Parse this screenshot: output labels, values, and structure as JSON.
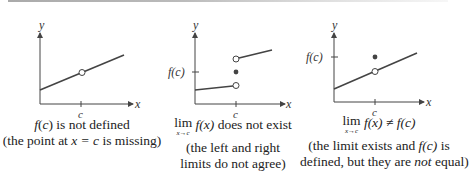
{
  "panels": [
    {
      "axis_y": "y",
      "axis_x": "x",
      "tick_x": "c",
      "caption_line1": "f(c) is not defined",
      "caption_line2_pre": "(the point at ",
      "caption_line2_math": "x = c",
      "caption_line2_post": " is missing)"
    },
    {
      "axis_y": "y",
      "axis_x": "x",
      "tick_x": "c",
      "tick_y": "f(c)",
      "lim_word": "lim",
      "lim_sub": "x→c",
      "lim_expr": "f(x)",
      "lim_text": " does not exist",
      "caption_line2": "(the left and right",
      "caption_line3": "limits do not agree)"
    },
    {
      "axis_y": "y",
      "axis_x": "x",
      "tick_x": "c",
      "tick_y": "f(c)",
      "lim_word": "lim",
      "lim_sub": "x→c",
      "lim_expr": "f(x) ≠ f(c)",
      "caption_line2_pre": "(the limit exists and ",
      "caption_line2_math": "f(c)",
      "caption_line2_post": " is",
      "caption_line3_pre": "defined, but they are ",
      "caption_line3_em": "not",
      "caption_line3_post": " equal)"
    }
  ]
}
